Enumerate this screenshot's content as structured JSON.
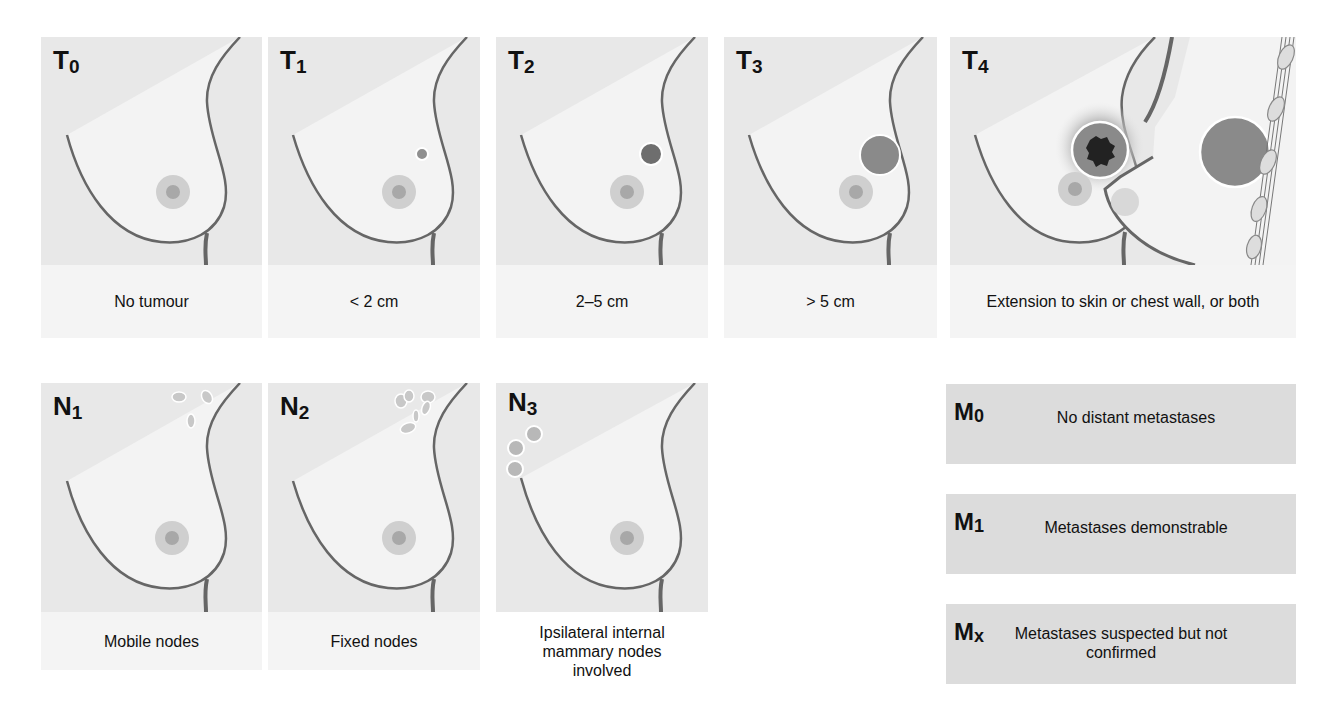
{
  "figure": "TNM staging of breast cancer",
  "tumour": [
    {
      "label": "T",
      "sub": "0",
      "caption": "No tumour"
    },
    {
      "label": "T",
      "sub": "1",
      "caption": "< 2 cm"
    },
    {
      "label": "T",
      "sub": "2",
      "caption": "2–5 cm"
    },
    {
      "label": "T",
      "sub": "3",
      "caption": "> 5 cm"
    },
    {
      "label": "T",
      "sub": "4",
      "caption": "Extension to skin or chest wall, or both"
    }
  ],
  "nodes": [
    {
      "label": "N",
      "sub": "1",
      "caption": "Mobile nodes"
    },
    {
      "label": "N",
      "sub": "2",
      "caption": "Fixed nodes"
    },
    {
      "label": "N",
      "sub": "3",
      "caption": "Ipsilateral internal mammary nodes involved"
    }
  ],
  "metastasis": [
    {
      "label": "M",
      "sub": "0",
      "caption": "No distant metastases"
    },
    {
      "label": "M",
      "sub": "1",
      "caption": "Metastases demonstrable"
    },
    {
      "label": "M",
      "sub": "x",
      "caption": "Metastases suspected but not confirmed"
    }
  ],
  "colors": {
    "panel_bg": "#e8e8e8",
    "breast": "#f3f3f3",
    "outline": "#666666",
    "tumour": "#8a8a8a",
    "caption_bg": "#f4f4f4",
    "m_box_bg": "#dcdcdc"
  }
}
